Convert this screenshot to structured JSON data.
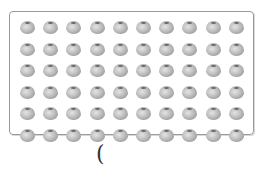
{
  "figure": {
    "rows": 6,
    "columns": 10,
    "item": "apple",
    "item_icon": "apple-icon",
    "total_items": 60
  },
  "answer_blank": {
    "open_paren": "(",
    "value": ""
  }
}
